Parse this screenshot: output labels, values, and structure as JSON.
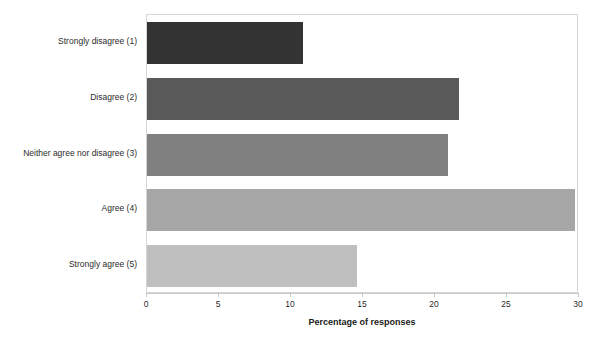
{
  "chart_data": {
    "type": "bar",
    "orientation": "horizontal",
    "title": "",
    "xlabel": "Percentage of responses",
    "ylabel": "",
    "categories": [
      "Strongly disagree (1)",
      "Disagree (2)",
      "Neither agree nor disagree (3)",
      "Agree (4)",
      "Strongly agree (5)"
    ],
    "values": [
      10.8,
      21.7,
      20.9,
      29.7,
      14.6
    ],
    "xlim": [
      0,
      30
    ],
    "xticks": [
      0,
      5,
      10,
      15,
      20,
      25,
      30
    ],
    "xtick_labels": [
      "0",
      "5",
      "10",
      "15",
      "20",
      "25",
      "30"
    ],
    "grid": false,
    "legend": false,
    "bar_colors": [
      "#333333",
      "#595959",
      "#808080",
      "#a6a6a6",
      "#bfbfbf"
    ],
    "plot_border_color": "#d6d6d6",
    "axis_color": "#c9c9c9",
    "text_color": "#2b2b2b"
  }
}
